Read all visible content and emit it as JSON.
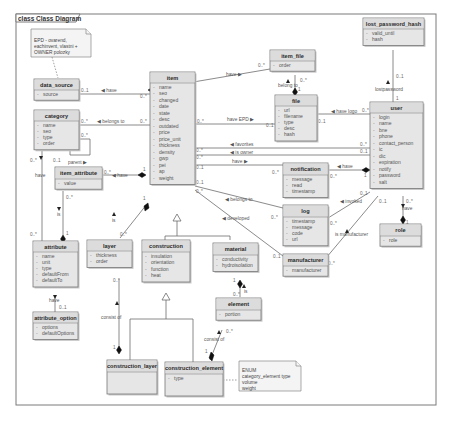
{
  "frame": {
    "title": "class Class Diagram"
  },
  "notes": {
    "epd": {
      "lines": [
        "EPD - ovarend,",
        "eachinvent, vlastni +",
        "OWNER polozky"
      ]
    },
    "enum": {
      "lines": [
        "ENUM",
        "category_element type",
        "volume",
        "weight"
      ]
    }
  },
  "classes": {
    "data_source": {
      "name": "data_source",
      "attrs": [
        "source"
      ]
    },
    "category": {
      "name": "category",
      "attrs": [
        "name",
        "seo",
        "type",
        "order"
      ]
    },
    "item_attribute": {
      "name": "item_attribute",
      "attrs": [
        "value"
      ]
    },
    "attribute": {
      "name": "attribute",
      "attrs": [
        "name",
        "unit",
        "type",
        "defaultFrom",
        "defaultTo"
      ]
    },
    "attribute_option": {
      "name": "attribute_option",
      "attrs": [
        "options",
        "defaultOptions"
      ]
    },
    "item": {
      "name": "item",
      "attrs": [
        "name",
        "seo",
        "changed",
        "date",
        "state",
        "desc",
        "outdated",
        "price",
        "price_unit",
        "thickness",
        "density",
        "gwp",
        "pei",
        "ap",
        "weight"
      ]
    },
    "layer": {
      "name": "layer",
      "attrs": [
        "thickness",
        "order"
      ]
    },
    "construction": {
      "name": "construction",
      "attrs": [
        "insulation",
        "orientation",
        "function",
        "heat"
      ]
    },
    "material": {
      "name": "material",
      "attrs": [
        "conductivity",
        "hydroisolation"
      ]
    },
    "element": {
      "name": "element",
      "attrs": [
        "portion"
      ]
    },
    "construction_layer": {
      "name": "construction_layer",
      "attrs": []
    },
    "construction_element": {
      "name": "construction_element",
      "attrs": [
        "type"
      ]
    },
    "item_file": {
      "name": "item_file",
      "attrs": [
        "order"
      ]
    },
    "file": {
      "name": "file",
      "attrs": [
        "url",
        "filename",
        "type",
        "desc",
        "hash"
      ]
    },
    "lost_password_hash": {
      "name": "lost_password_hash",
      "attrs": [
        "valid_until",
        "hash"
      ]
    },
    "user": {
      "name": "user",
      "attrs": [
        "login",
        "name",
        "bne",
        "phone",
        "contact_person",
        "ic",
        "dic",
        "expiration",
        "notify",
        "password",
        "salt"
      ]
    },
    "role": {
      "name": "role",
      "attrs": [
        "role"
      ]
    },
    "notification": {
      "name": "notification",
      "attrs": [
        "message",
        "read",
        "timestamp"
      ]
    },
    "log": {
      "name": "log",
      "attrs": [
        "timestamp",
        "message",
        "code",
        "url"
      ]
    },
    "manufacturer": {
      "name": "manufacturer",
      "attrs": [
        "manufacturer"
      ]
    }
  },
  "associations": [
    {
      "id": "ds-item",
      "label": "◀ have",
      "from_mult": "0..1",
      "to_mult": "0..*"
    },
    {
      "id": "cat-item",
      "label": "◀ belongs to",
      "from_mult": "0..*",
      "to_mult": "0..*"
    },
    {
      "id": "cat-parent",
      "label": "parent ▶",
      "from_mult": "0..*",
      "to_mult": "0..1"
    },
    {
      "id": "cat-attr",
      "label": "have",
      "from_mult": "0..*",
      "to_mult": "0..*"
    },
    {
      "id": "itemattr-item",
      "label": "◀ have",
      "from_mult": "0..*",
      "to_mult": "1"
    },
    {
      "id": "itemattr-attr",
      "label": "is",
      "from_mult": "0..*",
      "to_mult": "1"
    },
    {
      "id": "attr-option",
      "label": "have",
      "from_mult": "",
      "to_mult": "0..1"
    },
    {
      "id": "item-layer",
      "label": "is",
      "from_mult": "1",
      "to_mult": "0..*"
    },
    {
      "id": "layer-cl",
      "label": "consist of",
      "from_mult": "0..*",
      "to_mult": "1"
    },
    {
      "id": "material-element",
      "label": "is",
      "from_mult": "1",
      "to_mult": "0..*"
    },
    {
      "id": "element-ce",
      "label": "consist of",
      "from_mult": "0..*",
      "to_mult": "1"
    },
    {
      "id": "item-itemfile",
      "label": "have ▶",
      "from_mult": "1",
      "to_mult": "0..*"
    },
    {
      "id": "itemfile-file",
      "label": "belong to",
      "from_mult": "0..*",
      "to_mult": "1"
    },
    {
      "id": "item-file-epd",
      "label": "have EPD ▶",
      "from_mult": "0..*",
      "to_mult": "0..1"
    },
    {
      "id": "file-user",
      "label": "◀ have logo",
      "from_mult": "0..1",
      "to_mult": "0..*"
    },
    {
      "id": "lph-user",
      "label": "lostpassword",
      "from_mult": "0..1",
      "to_mult": "1"
    },
    {
      "id": "item-user-fav",
      "label": "◀ favorites",
      "from_mult": "0..*",
      "to_mult": "0..*"
    },
    {
      "id": "item-user-owner",
      "label": "◀ is owner",
      "from_mult": "0..*",
      "to_mult": "0..1"
    },
    {
      "id": "item-notif",
      "label": "have ▶",
      "from_mult": "0..1",
      "to_mult": "0..*"
    },
    {
      "id": "notif-user",
      "label": "◀ have",
      "from_mult": "0..*",
      "to_mult": "1"
    },
    {
      "id": "item-log",
      "label": "◀ belongs to",
      "from_mult": "0..1",
      "to_mult": "0..*"
    },
    {
      "id": "log-user",
      "label": "◀ invoked",
      "from_mult": "0..*",
      "to_mult": "0..1"
    },
    {
      "id": "item-manuf",
      "label": "◀ developed",
      "from_mult": "0..*",
      "to_mult": "0..1"
    },
    {
      "id": "user-manuf",
      "label": "is manufacturer",
      "from_mult": "0..1",
      "to_mult": "0..*"
    },
    {
      "id": "user-role",
      "label": "have",
      "from_mult": "0..*",
      "to_mult": "1"
    }
  ]
}
